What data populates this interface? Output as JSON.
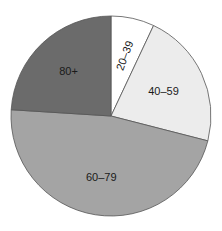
{
  "chart_data": {
    "type": "pie",
    "title": "",
    "start_angle_deg": 0,
    "direction": "clockwise",
    "categories": [
      "20–39",
      "40–59",
      "60–79",
      "80+"
    ],
    "values": [
      7,
      22,
      47,
      24
    ],
    "unit": "percent (estimated)",
    "colors": [
      "#ffffff",
      "#ececec",
      "#a4a4a4",
      "#6b6b6b"
    ],
    "stroke_color": "#555555",
    "legend": "none (labels inside slices)",
    "labels": [
      {
        "text": "20–39",
        "rotation_deg": -70
      },
      {
        "text": "40–59",
        "rotation_deg": 0
      },
      {
        "text": "60–79",
        "rotation_deg": 0
      },
      {
        "text": "80+",
        "rotation_deg": 0
      }
    ]
  }
}
